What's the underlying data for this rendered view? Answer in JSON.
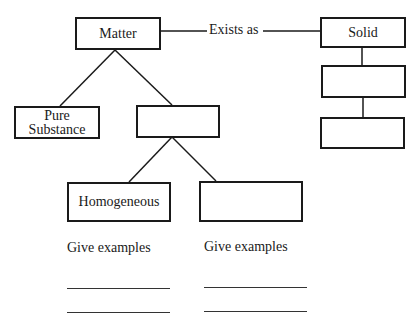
{
  "diagram": {
    "nodes": {
      "matter": "Matter",
      "pure_substance": "Pure Substance",
      "mixture_blank": "",
      "homogeneous": "Homogeneous",
      "heterogeneous_blank": "",
      "solid": "Solid",
      "state_blank_1": "",
      "state_blank_2": ""
    },
    "edge_labels": {
      "matter_to_solid": "Exists as"
    },
    "prompts": {
      "left": "Give examples",
      "right": "Give examples"
    },
    "answer_lines": {
      "left": [
        "",
        ""
      ],
      "right": [
        "",
        ""
      ]
    },
    "line_color": "#1a1a1a"
  }
}
